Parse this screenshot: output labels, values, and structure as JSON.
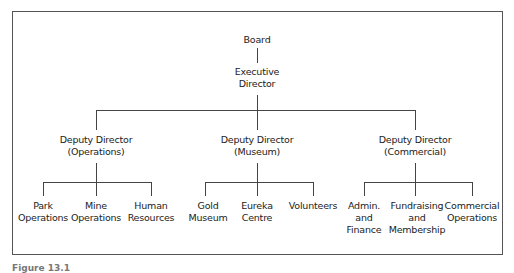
{
  "chart": {
    "type": "org-chart",
    "root": {
      "label": "Board",
      "child": {
        "label_line1": "Executive",
        "label_line2": "Director",
        "children": [
          {
            "label_line1": "Deputy Director",
            "label_line2": "(Operations)",
            "children": [
              {
                "line1": "Park",
                "line2": "Operations"
              },
              {
                "line1": "Mine",
                "line2": "Operations"
              },
              {
                "line1": "Human",
                "line2": "Resources"
              }
            ]
          },
          {
            "label_line1": "Deputy Director",
            "label_line2": "(Museum)",
            "children": [
              {
                "line1": "Gold",
                "line2": "Museum"
              },
              {
                "line1": "Eureka",
                "line2": "Centre"
              },
              {
                "line1": "Volunteers",
                "line2": ""
              }
            ]
          },
          {
            "label_line1": "Deputy Director",
            "label_line2": "(Commercial)",
            "children": [
              {
                "line1": "Admin.",
                "line2": "and",
                "line3": "Finance"
              },
              {
                "line1": "Fundraising",
                "line2": "and",
                "line3": "Membership"
              },
              {
                "line1": "Commercial",
                "line2": "Operations",
                "line3": ""
              }
            ]
          }
        ]
      }
    }
  },
  "caption": "Figure 13.1"
}
